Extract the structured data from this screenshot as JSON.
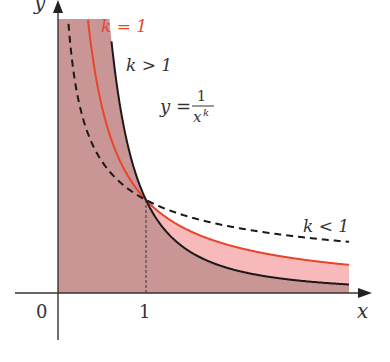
{
  "figure": {
    "axes": {
      "x_label": "x",
      "y_label": "y",
      "origin_label": "0",
      "x_tick_label": "1"
    },
    "formula": {
      "lhs": "y =",
      "numerator": "1",
      "denominator_base": "x",
      "denominator_exponent": "k"
    },
    "curves": [
      {
        "label": "k = 1",
        "style": "solid",
        "color": "#e8462c",
        "k": 1
      },
      {
        "label": "k > 1",
        "style": "solid",
        "color": "#1a1a1a",
        "k": 2
      },
      {
        "label": "k < 1",
        "style": "dashed",
        "color": "#1a1a1a",
        "k": 0.5
      }
    ],
    "colors": {
      "fill_light": "#f7b9b9",
      "fill_dark": "#c99595",
      "axis": "#333333"
    }
  }
}
